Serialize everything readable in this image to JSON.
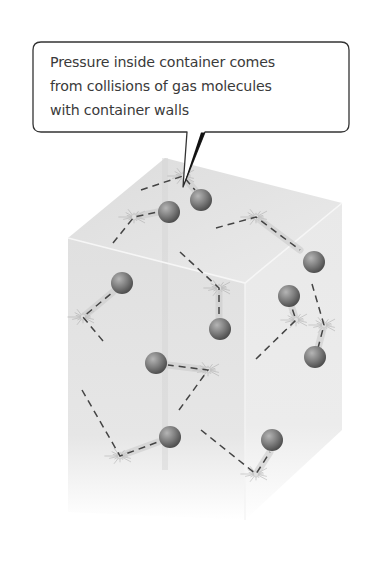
{
  "callout": {
    "lines": [
      "Pressure inside container comes",
      "from collisions of gas molecules",
      "with container walls"
    ],
    "box": {
      "x": 33,
      "y": 42,
      "w": 316,
      "h": 90,
      "r": 8
    },
    "pointer": {
      "base_left_x": 187,
      "base_right_x": 205,
      "base_y": 131,
      "tip_x": 183,
      "tip_y": 187
    },
    "stroke_color": "#333333",
    "fill_color": "#ffffff"
  },
  "container": {
    "label": "gas container",
    "top_face": [
      [
        165,
        158
      ],
      [
        342,
        203
      ],
      [
        245,
        283
      ],
      [
        68,
        238
      ]
    ],
    "front_face": [
      [
        68,
        238
      ],
      [
        245,
        283
      ],
      [
        245,
        520
      ],
      [
        68,
        512
      ]
    ],
    "right_face": [
      [
        245,
        283
      ],
      [
        342,
        203
      ],
      [
        342,
        430
      ],
      [
        245,
        520
      ]
    ],
    "back_vertical_x": 165,
    "colors": {
      "top_face": "#e4e4e4",
      "front_face": "#dedede",
      "right_face": "#e8e8e8",
      "edge_highlight": "#f6f6f6"
    }
  },
  "molecules": {
    "color": "#7d7d7d",
    "highlight": "#b5b5b5",
    "shadow": "#4d4d4d",
    "radius": 11,
    "items": [
      {
        "id": "m1",
        "x": 201,
        "y": 200
      },
      {
        "id": "m2",
        "x": 169,
        "y": 212
      },
      {
        "id": "m3",
        "x": 314,
        "y": 262
      },
      {
        "id": "m4",
        "x": 122,
        "y": 283
      },
      {
        "id": "m5",
        "x": 289,
        "y": 296
      },
      {
        "id": "m6",
        "x": 220,
        "y": 329
      },
      {
        "id": "m7",
        "x": 315,
        "y": 357
      },
      {
        "id": "m8",
        "x": 156,
        "y": 363
      },
      {
        "id": "m9",
        "x": 170,
        "y": 437
      },
      {
        "id": "m10",
        "x": 272,
        "y": 440
      }
    ]
  },
  "paths": {
    "color": "#444444",
    "dash": "7 5",
    "items": [
      {
        "id": "p1",
        "points": [
          [
            141,
            190
          ],
          [
            183,
            176
          ],
          [
            195,
            190
          ]
        ]
      },
      {
        "id": "p2",
        "points": [
          [
            113,
            243
          ],
          [
            134,
            217
          ],
          [
            158,
            212
          ]
        ]
      },
      {
        "id": "p3",
        "points": [
          [
            216,
            228
          ],
          [
            256,
            217
          ],
          [
            300,
            250
          ]
        ]
      },
      {
        "id": "p4",
        "points": [
          [
            180,
            252
          ],
          [
            219,
            288
          ],
          [
            219,
            318
          ]
        ]
      },
      {
        "id": "p5",
        "points": [
          [
            103,
            341
          ],
          [
            83,
            317
          ],
          [
            113,
            292
          ]
        ]
      },
      {
        "id": "p6",
        "points": [
          [
            312,
            284
          ],
          [
            324,
            325
          ],
          [
            318,
            348
          ]
        ]
      },
      {
        "id": "p7",
        "points": [
          [
            256,
            359
          ],
          [
            296,
            320
          ],
          [
            292,
            308
          ]
        ]
      },
      {
        "id": "p8",
        "points": [
          [
            179,
            410
          ],
          [
            208,
            370
          ],
          [
            168,
            365
          ]
        ]
      },
      {
        "id": "p9",
        "points": [
          [
            82,
            390
          ],
          [
            120,
            456
          ],
          [
            158,
            442
          ]
        ]
      },
      {
        "id": "p10",
        "points": [
          [
            201,
            430
          ],
          [
            256,
            474
          ],
          [
            270,
            452
          ]
        ]
      }
    ]
  },
  "collisions": {
    "color": "#9a9a9a",
    "items": [
      {
        "id": "c1",
        "x": 183,
        "y": 176
      },
      {
        "id": "c2",
        "x": 134,
        "y": 217
      },
      {
        "id": "c3",
        "x": 256,
        "y": 217
      },
      {
        "id": "c4",
        "x": 219,
        "y": 288
      },
      {
        "id": "c5",
        "x": 83,
        "y": 317
      },
      {
        "id": "c6",
        "x": 324,
        "y": 325
      },
      {
        "id": "c7",
        "x": 296,
        "y": 320
      },
      {
        "id": "c8",
        "x": 208,
        "y": 370
      },
      {
        "id": "c9",
        "x": 120,
        "y": 456
      },
      {
        "id": "c10",
        "x": 256,
        "y": 474
      }
    ]
  }
}
